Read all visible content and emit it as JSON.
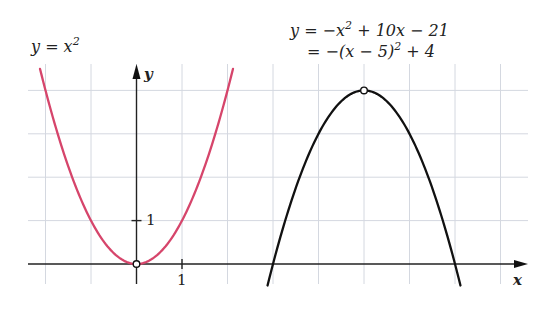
{
  "chart_data": {
    "type": "line",
    "title": "",
    "xlabel": "x",
    "ylabel": "y",
    "xlim": [
      -2.4,
      8.5
    ],
    "ylim": [
      -0.45,
      4.6
    ],
    "grid": true,
    "grid_step": 1,
    "ticks": {
      "x": [
        {
          "value": 1,
          "label": "1"
        }
      ],
      "y": [
        {
          "value": 1,
          "label": "1"
        }
      ]
    },
    "series": [
      {
        "name": "y = x^2",
        "color": "#d6456b",
        "formula": "x^2",
        "x_range": [
          -2.12,
          2.12
        ],
        "key_point": {
          "x": 0,
          "y": 0,
          "label": "vertex"
        }
      },
      {
        "name": "y = -x^2 + 10x - 21",
        "color": "#111111",
        "formula": "-(x-5)^2+4",
        "x_range": [
          2.88,
          7.12
        ],
        "key_point": {
          "x": 5,
          "y": 4,
          "label": "vertex"
        },
        "roots": [
          3,
          7
        ]
      }
    ],
    "annotations": {
      "red_label": {
        "prefix": "y = x",
        "sup": "2"
      },
      "black_label_line1": {
        "a": "y = −x",
        "sup": "2",
        "b": " + 10x − 21"
      },
      "black_label_line2": {
        "a": "= −(x − 5)",
        "sup": "2",
        "b": " + 4"
      }
    },
    "legend": "none"
  }
}
